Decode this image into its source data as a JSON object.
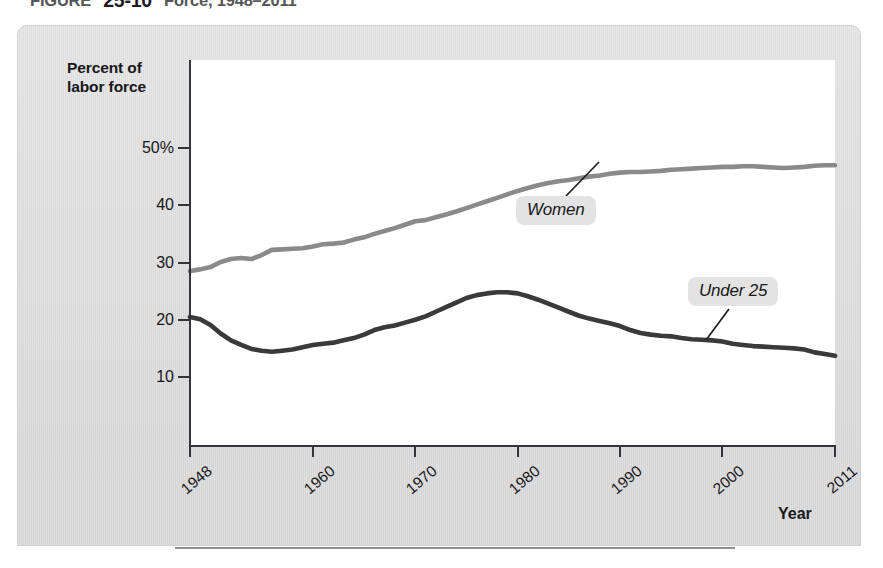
{
  "figure": {
    "title_prefix": "FIGURE",
    "title_number": "25-10",
    "title_rest": " Force, 1948–2011"
  },
  "axes": {
    "y_axis_title_line1": "Percent of",
    "y_axis_title_line2": "labor force",
    "x_axis_title": "Year"
  },
  "chart_data": {
    "type": "line",
    "title": "FIGURE 25-10  Force, 1948–2011",
    "xlabel": "Year",
    "ylabel": "Percent of labor force",
    "xlim": [
      1948,
      2011
    ],
    "ylim": [
      0,
      52
    ],
    "grid": false,
    "legend_position": "inline-annotations",
    "y_ticks": [
      {
        "value": 50,
        "label": "50%"
      },
      {
        "value": 40,
        "label": "40"
      },
      {
        "value": 30,
        "label": "30"
      },
      {
        "value": 20,
        "label": "20"
      },
      {
        "value": 10,
        "label": "10"
      }
    ],
    "x_ticks": [
      {
        "value": 1948,
        "label": "1948"
      },
      {
        "value": 1960,
        "label": "1960"
      },
      {
        "value": 1970,
        "label": "1970"
      },
      {
        "value": 1980,
        "label": "1980"
      },
      {
        "value": 1990,
        "label": "1990"
      },
      {
        "value": 2000,
        "label": "2000"
      },
      {
        "value": 2011,
        "label": "2011"
      }
    ],
    "series": [
      {
        "name": "Women",
        "color": "#8a8a8a",
        "annotation": "Women",
        "x": [
          1948,
          1949,
          1950,
          1951,
          1952,
          1953,
          1954,
          1955,
          1956,
          1957,
          1958,
          1959,
          1960,
          1961,
          1962,
          1963,
          1964,
          1965,
          1966,
          1967,
          1968,
          1969,
          1970,
          1971,
          1972,
          1973,
          1974,
          1975,
          1976,
          1977,
          1978,
          1979,
          1980,
          1981,
          1982,
          1983,
          1984,
          1985,
          1986,
          1987,
          1988,
          1989,
          1990,
          1991,
          1992,
          1993,
          1994,
          1995,
          1996,
          1997,
          1998,
          1999,
          2000,
          2001,
          2002,
          2003,
          2004,
          2005,
          2006,
          2007,
          2008,
          2009,
          2010,
          2011
        ],
        "values": [
          28.5,
          28.8,
          29.2,
          30.1,
          30.6,
          30.8,
          30.6,
          31.3,
          32.2,
          32.3,
          32.4,
          32.5,
          32.8,
          33.2,
          33.3,
          33.5,
          34.0,
          34.4,
          35.0,
          35.5,
          36.0,
          36.6,
          37.2,
          37.4,
          37.9,
          38.4,
          38.9,
          39.5,
          40.1,
          40.7,
          41.3,
          41.9,
          42.5,
          43.0,
          43.5,
          43.9,
          44.2,
          44.4,
          44.7,
          45.0,
          45.2,
          45.5,
          45.7,
          45.8,
          45.8,
          45.9,
          46.0,
          46.2,
          46.3,
          46.4,
          46.5,
          46.6,
          46.7,
          46.7,
          46.8,
          46.8,
          46.7,
          46.6,
          46.5,
          46.6,
          46.7,
          46.9,
          47.0,
          47.0
        ]
      },
      {
        "name": "Under 25",
        "color": "#3a3a3a",
        "annotation": "Under 25",
        "x": [
          1948,
          1949,
          1950,
          1951,
          1952,
          1953,
          1954,
          1955,
          1956,
          1957,
          1958,
          1959,
          1960,
          1961,
          1962,
          1963,
          1964,
          1965,
          1966,
          1967,
          1968,
          1969,
          1970,
          1971,
          1972,
          1973,
          1974,
          1975,
          1976,
          1977,
          1978,
          1979,
          1980,
          1981,
          1982,
          1983,
          1984,
          1985,
          1986,
          1987,
          1988,
          1989,
          1990,
          1991,
          1992,
          1993,
          1994,
          1995,
          1996,
          1997,
          1998,
          1999,
          2000,
          2001,
          2002,
          2003,
          2004,
          2005,
          2006,
          2007,
          2008,
          2009,
          2010,
          2011
        ],
        "values": [
          20.5,
          20.1,
          19.1,
          17.6,
          16.4,
          15.6,
          14.9,
          14.6,
          14.4,
          14.6,
          14.8,
          15.2,
          15.6,
          15.8,
          16.0,
          16.4,
          16.8,
          17.4,
          18.2,
          18.7,
          19.0,
          19.5,
          20.0,
          20.6,
          21.4,
          22.2,
          23.0,
          23.8,
          24.3,
          24.6,
          24.8,
          24.8,
          24.6,
          24.1,
          23.5,
          22.8,
          22.1,
          21.4,
          20.7,
          20.2,
          19.8,
          19.4,
          18.9,
          18.2,
          17.7,
          17.4,
          17.2,
          17.1,
          16.8,
          16.6,
          16.5,
          16.4,
          16.2,
          15.8,
          15.6,
          15.4,
          15.3,
          15.2,
          15.1,
          15.0,
          14.8,
          14.3,
          14.0,
          13.7
        ]
      }
    ]
  },
  "annotations": {
    "women_label": "Women",
    "under25_label": "Under 25"
  },
  "colors": {
    "panel": "#dedede",
    "plot_background": "#ffffff",
    "axis": "#34343a",
    "women_line": "#8a8a8a",
    "under25_line": "#3a3a3a",
    "badge_background": "#e3e3e3",
    "rule": "#8e8e94"
  }
}
